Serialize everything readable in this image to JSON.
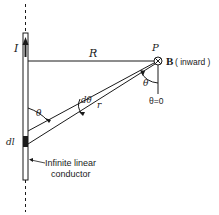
{
  "figure": {
    "labels": {
      "current": "I",
      "distance": "R",
      "point": "P",
      "field_symbol": "B",
      "field_direction": "( inward )",
      "dtheta": "dθ",
      "radius": "r",
      "theta_bottom": "θ",
      "theta_top": "θ",
      "theta_zero": "θ=0",
      "element": "dl",
      "conductor_line1": "Infinite linear",
      "conductor_line2": "conductor"
    },
    "colors": {
      "ink": "#1a1a1a",
      "background": "#ffffff"
    }
  }
}
